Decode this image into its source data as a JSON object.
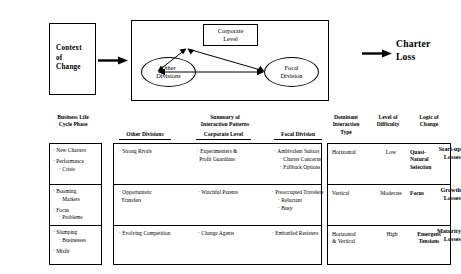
{
  "diagram": {
    "context_box": {
      "name": "Context of Change",
      "lines": [
        "Context",
        "of",
        "Change"
      ]
    },
    "system": {
      "corporate": {
        "line1": "Corporate",
        "line2": "Level"
      },
      "other_divisions": {
        "line1": "Other",
        "line2": "Divisions"
      },
      "focal_division": {
        "line1": "Focal",
        "line2": "Division"
      }
    },
    "outcome": {
      "line1": "Charter",
      "line2": "Loss"
    }
  },
  "table": {
    "group_headers": {
      "life_cycle": "Business Life\nCycle Phase",
      "life_cycle_l1": "Business Life",
      "life_cycle_l2": "Cycle Phase",
      "summary_l1": "Summary of",
      "summary_l2": "Interaction Patterns",
      "dominant_l1": "Dominant",
      "dominant_l2": "Interaction",
      "dominant_l3": "Type",
      "difficulty_l1": "Level of",
      "difficulty_l2": "Difficulty",
      "logic_l1": "Logic of",
      "logic_l2": "Change"
    },
    "sub_headers": {
      "other_divisions": "Other Divisions",
      "corporate_level": "Corporate Level",
      "focal_division": "Focal Division"
    },
    "rows": [
      {
        "phase_l1": "Start-up",
        "phase_l2": "Losses",
        "life_cycle_items": [
          "New Charters",
          "Performance",
          "Crisis"
        ],
        "life_cycle_bullets": [
          {
            "text": "New Charters",
            "sub": false
          },
          {
            "text": "Performance",
            "sub": false
          },
          {
            "text": "Crisis",
            "sub": true
          }
        ],
        "other_divisions": [
          {
            "text": "Strong Rivals",
            "sub": false
          }
        ],
        "corporate_level": [
          {
            "text": "Experimenters &",
            "sub": false
          },
          {
            "text": "Profit Guardians",
            "sub": true
          }
        ],
        "focal_division": [
          {
            "text": "Ambivalent Suitors",
            "sub": false
          },
          {
            "text": "Charter Concerns",
            "sub": true
          },
          {
            "text": "Fallback Options",
            "sub": true
          }
        ],
        "dominant_interaction": "Horizontal",
        "level_of_difficulty": "Low",
        "logic_of_change_l1": "Quasi-",
        "logic_of_change_l2": "Natural",
        "logic_of_change_l3": "Selection"
      },
      {
        "phase_l1": "Growth",
        "phase_l2": "Losses",
        "life_cycle_bullets": [
          {
            "text": "Booming",
            "sub": false
          },
          {
            "text": "Markets",
            "sub": true
          },
          {
            "text": "Focus",
            "sub": false
          },
          {
            "text": "Problems",
            "sub": true
          }
        ],
        "other_divisions": [
          {
            "text": "Opportunistic",
            "sub": false
          },
          {
            "text": "Transfers",
            "sub": true
          }
        ],
        "corporate_level": [
          {
            "text": "Watchful Parents",
            "sub": false
          }
        ],
        "focal_division": [
          {
            "text": "Preoccupied Travelers",
            "sub": false
          },
          {
            "text": "Reluctant",
            "sub": true
          },
          {
            "text": "Busy",
            "sub": true
          }
        ],
        "dominant_interaction": "Vertical",
        "level_of_difficulty": "Moderate",
        "logic_of_change_l1": "Focus",
        "logic_of_change_l2": "",
        "logic_of_change_l3": ""
      },
      {
        "phase_l1": "Maturity",
        "phase_l2": "Losses",
        "life_cycle_bullets": [
          {
            "text": "Slumping",
            "sub": false
          },
          {
            "text": "Businesses",
            "sub": true
          },
          {
            "text": "Misfit",
            "sub": false
          }
        ],
        "other_divisions": [
          {
            "text": "Evolving Competition",
            "sub": false
          }
        ],
        "corporate_level": [
          {
            "text": "Change Agents",
            "sub": false
          }
        ],
        "focal_division": [
          {
            "text": "Embattled Resisters",
            "sub": false
          }
        ],
        "dominant_interaction_l1": "Horizontal",
        "dominant_interaction_l2": "& Vertical",
        "level_of_difficulty": "High",
        "logic_of_change_l1": "Emergent",
        "logic_of_change_l2": "Tensions",
        "logic_of_change_l3": ""
      }
    ]
  },
  "colors": {
    "ink": "#000000",
    "paper": "#ffffff"
  }
}
